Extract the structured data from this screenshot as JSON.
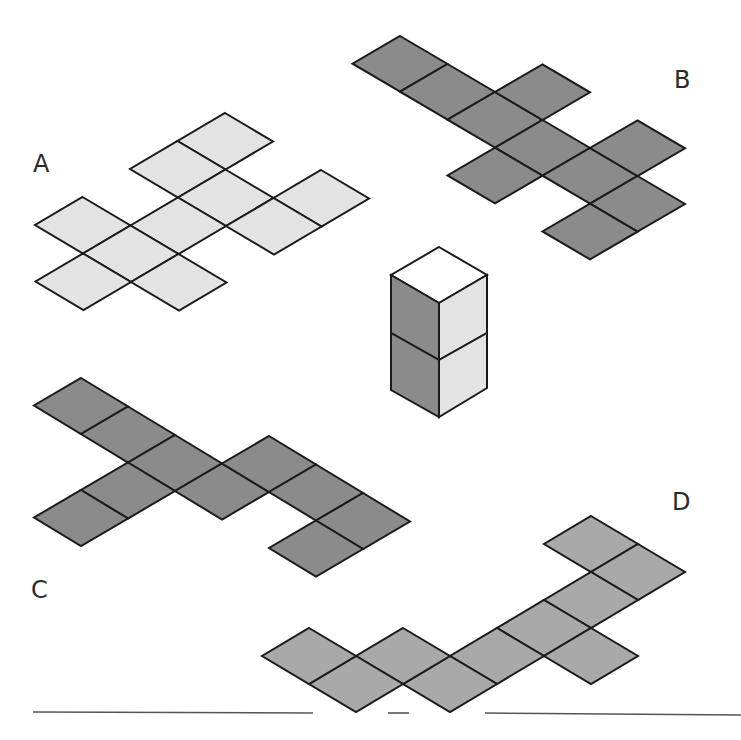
{
  "figure": {
    "labels": [
      {
        "text": "A",
        "x": 33,
        "y": 152
      },
      {
        "text": "B",
        "x": 674,
        "y": 68
      },
      {
        "text": "C",
        "x": 31,
        "y": 578
      },
      {
        "text": "D",
        "x": 672,
        "y": 490
      }
    ],
    "colors": {
      "stroke": "#1a1a1a",
      "light": "#e3e3e3",
      "dark": "#8b8b8b",
      "medium": "#a9a9a9",
      "white": "#ffffff",
      "line": "#555555"
    },
    "nets": [
      {
        "id": "A",
        "fill": "#e3e3e3",
        "origin": [
          225,
          113
        ],
        "a": [
          48,
          28.5
        ],
        "b": [
          -47.5,
          28
        ],
        "cells": [
          [
            0,
            0
          ],
          [
            0,
            1
          ],
          [
            1,
            1
          ],
          [
            2,
            0
          ],
          [
            2,
            1
          ],
          [
            1,
            2
          ],
          [
            0,
            3
          ],
          [
            1,
            3
          ],
          [
            1,
            4
          ],
          [
            2,
            3
          ]
        ]
      },
      {
        "id": "B",
        "fill": "#8b8b8b",
        "origin": [
          400,
          36
        ],
        "a": [
          47.5,
          28
        ],
        "b": [
          -47.5,
          27.7
        ],
        "cells": [
          [
            0,
            0
          ],
          [
            1,
            0
          ],
          [
            2,
            0
          ],
          [
            2,
            -1
          ],
          [
            3,
            0
          ],
          [
            3,
            1
          ],
          [
            4,
            0
          ],
          [
            4,
            -1
          ],
          [
            5,
            0
          ],
          [
            5,
            1
          ]
        ]
      },
      {
        "id": "C",
        "fill": "#8b8b8b",
        "origin": [
          81,
          378
        ],
        "a": [
          47,
          28.5
        ],
        "b": [
          -47,
          27.5
        ],
        "cells": [
          [
            0,
            0
          ],
          [
            1,
            0
          ],
          [
            2,
            0
          ],
          [
            3,
            0
          ],
          [
            2,
            1
          ],
          [
            2,
            2
          ],
          [
            3,
            -1
          ],
          [
            4,
            -1
          ],
          [
            5,
            -1
          ],
          [
            5,
            0
          ]
        ]
      },
      {
        "id": "D",
        "fill": "#a9a9a9",
        "origin": [
          591,
          516
        ],
        "a": [
          47,
          28
        ],
        "b": [
          -47,
          28
        ],
        "cells": [
          [
            0,
            0
          ],
          [
            1,
            0
          ],
          [
            1,
            1
          ],
          [
            1,
            2
          ],
          [
            2,
            2
          ],
          [
            1,
            3
          ],
          [
            1,
            4
          ],
          [
            0,
            4
          ],
          [
            0,
            5
          ],
          [
            -1,
            5
          ]
        ]
      }
    ],
    "cuboid": {
      "top_face": {
        "fill": "#ffffff",
        "points": [
          [
            439,
            247
          ],
          [
            487,
            275
          ],
          [
            439,
            303
          ],
          [
            391,
            275
          ]
        ]
      },
      "left_faces": [
        {
          "fill": "#8b8b8b",
          "points": [
            [
              391,
              275
            ],
            [
              439,
              303
            ],
            [
              439,
              360
            ],
            [
              391,
              333
            ]
          ]
        },
        {
          "fill": "#8b8b8b",
          "points": [
            [
              391,
              333
            ],
            [
              439,
              360
            ],
            [
              439,
              417
            ],
            [
              391,
              390
            ]
          ]
        }
      ],
      "right_faces": [
        {
          "fill": "#e3e3e3",
          "points": [
            [
              439,
              303
            ],
            [
              487,
              275
            ],
            [
              487,
              333
            ],
            [
              439,
              360
            ]
          ]
        },
        {
          "fill": "#e3e3e3",
          "points": [
            [
              439,
              360
            ],
            [
              487,
              333
            ],
            [
              487,
              388
            ],
            [
              439,
              417
            ]
          ]
        }
      ]
    },
    "baseline_segments": [
      {
        "x1": 33,
        "y1": 712,
        "x2": 313,
        "y2": 713
      },
      {
        "x1": 388,
        "y1": 713,
        "x2": 409,
        "y2": 713
      },
      {
        "x1": 485,
        "y1": 713,
        "x2": 741,
        "y2": 715
      }
    ]
  }
}
